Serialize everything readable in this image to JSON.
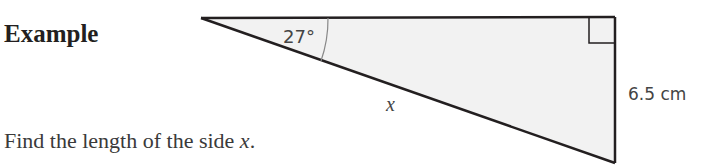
{
  "heading": "Example",
  "question": {
    "text": "Find the length of the side ",
    "variable": "x",
    "end": "."
  },
  "diagram": {
    "shape": "right-angled triangle",
    "angle_label": "27°",
    "hypotenuse_label": "x",
    "opposite_label": "6.5 cm",
    "fill_color": "#f2f2f2",
    "stroke_color": "#231f20"
  }
}
